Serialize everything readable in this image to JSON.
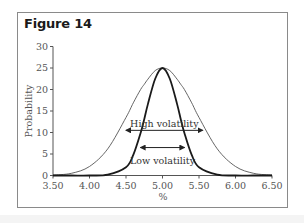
{
  "figure": {
    "title": "Figure 14"
  },
  "chart_data": {
    "type": "line",
    "title": "Figure 14",
    "xlabel": "%",
    "ylabel": "Probability",
    "xlim": [
      3.5,
      6.5
    ],
    "ylim": [
      0,
      30
    ],
    "x_ticks": [
      "3.50",
      "4.00",
      "4.50",
      "5.00",
      "5.50",
      "6.00",
      "6.50"
    ],
    "y_ticks": [
      "0",
      "5",
      "10",
      "15",
      "20",
      "25",
      "30"
    ],
    "grid": false,
    "legend": null,
    "x": [
      3.5,
      3.75,
      4.0,
      4.25,
      4.5,
      4.6,
      4.7,
      4.75,
      4.8,
      4.9,
      5.0,
      5.1,
      5.2,
      5.25,
      5.3,
      5.4,
      5.5,
      5.75,
      6.0,
      6.25,
      6.5
    ],
    "series": [
      {
        "name": "High volatility",
        "style": "thin",
        "color": "#555555",
        "values": [
          0.1,
          0.5,
          2.1,
          6.2,
          13.5,
          16.9,
          20.0,
          21.2,
          22.4,
          24.4,
          25.0,
          24.4,
          22.4,
          21.2,
          20.0,
          16.9,
          13.5,
          6.2,
          2.1,
          0.5,
          0.1
        ]
      },
      {
        "name": "Low volatility",
        "style": "thick",
        "color": "#1a1a1a",
        "values": [
          0.0,
          0.0,
          0.0,
          0.2,
          1.9,
          4.8,
          9.9,
          13.1,
          16.6,
          22.5,
          25.0,
          22.5,
          16.6,
          13.1,
          9.9,
          4.8,
          1.9,
          0.2,
          0.0,
          0.0,
          0.0
        ]
      }
    ],
    "annotations": [
      {
        "text": "High volatility",
        "arrow": "double",
        "x_from": 4.5,
        "x_to": 5.55,
        "y": 10.5
      },
      {
        "text": "Low volatility",
        "arrow": "double",
        "x_from": 4.7,
        "x_to": 5.3,
        "y": 6.5
      }
    ]
  }
}
